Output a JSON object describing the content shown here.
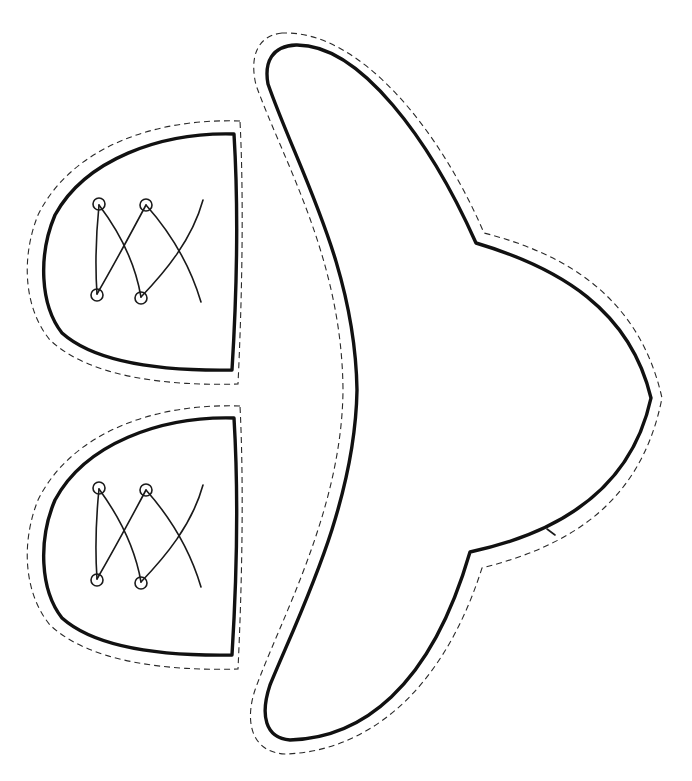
{
  "title": "Shoe craft cut-out template",
  "colors": {
    "background": "#ffffff",
    "outline": "#111111",
    "cut_line": "#2a2a2a"
  },
  "pieces": [
    {
      "name": "shoe-toe-top",
      "eyelets": 4,
      "lace_crossings": 2
    },
    {
      "name": "shoe-toe-bottom",
      "eyelets": 4,
      "lace_crossings": 2
    },
    {
      "name": "shoe-sole-bowtie"
    }
  ],
  "legend": {
    "solid_line": "outline",
    "dashed_line": "cut line"
  }
}
